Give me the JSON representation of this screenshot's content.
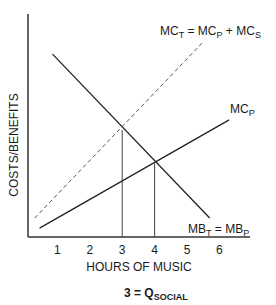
{
  "chart_data": {
    "type": "line",
    "title": "",
    "xlabel": "HOURS OF MUSIC",
    "ylabel": "COSTS/BENEFITS",
    "x_ticks": [
      "1",
      "2",
      "3",
      "4",
      "5",
      "6"
    ],
    "xlim": [
      0,
      6.9
    ],
    "ylim": [
      0,
      10
    ],
    "grid": false,
    "series": [
      {
        "name": "MB_T = MB_P",
        "label_main": "MB",
        "label_sub1": "T",
        "label_mid": " = MB",
        "label_sub2": "P",
        "style": "solid",
        "points": [
          [
            0.85,
            8.2
          ],
          [
            5.7,
            0.85
          ]
        ]
      },
      {
        "name": "MC_P",
        "label_main": "MC",
        "label_sub1": "P",
        "style": "solid",
        "points": [
          [
            0.45,
            0.4
          ],
          [
            6.3,
            5.25
          ]
        ]
      },
      {
        "name": "MC_T = MC_P + MC_S",
        "label_main": "MC",
        "label_sub1": "T",
        "label_mid": " = MC",
        "label_sub2": "P",
        "label_mid2": " + MC",
        "label_sub3": "S",
        "style": "dashed",
        "points": [
          [
            0.3,
            0.85
          ],
          [
            5.5,
            8.75
          ]
        ]
      }
    ],
    "vertical_lines": [
      {
        "x": 3,
        "y": 4.8
      },
      {
        "x": 4,
        "y": 3.3
      }
    ],
    "annotation": {
      "main": "3 = Q",
      "sub": "SOCIAL"
    }
  }
}
